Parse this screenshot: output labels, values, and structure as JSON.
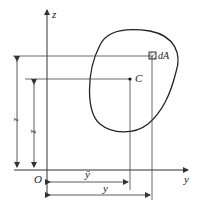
{
  "diagram": {
    "axes": {
      "z_label": "z",
      "y_label": "y",
      "origin_label": "O"
    },
    "points": {
      "centroid_label": "C",
      "element_label": "dA"
    },
    "dimensions": {
      "z_label": "z",
      "zbar_label": "z̄",
      "y_label": "y",
      "ybar_label": "ȳ"
    },
    "colors": {
      "line": "#333333",
      "background": "#ffffff"
    }
  }
}
